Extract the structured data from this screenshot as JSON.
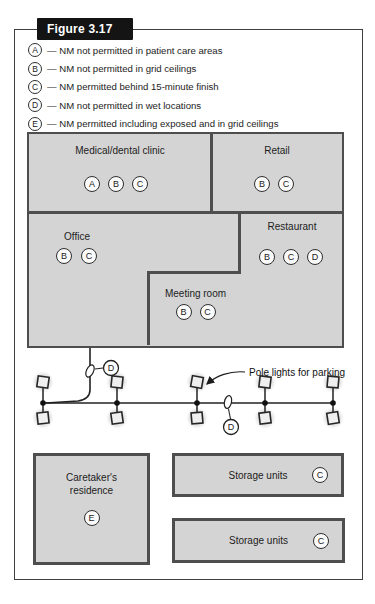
{
  "figure": {
    "title": "Figure 3.17"
  },
  "legend": {
    "items": [
      {
        "letter": "A",
        "text": "— NM not permitted in patient care areas"
      },
      {
        "letter": "B",
        "text": "— NM not permitted in grid ceilings"
      },
      {
        "letter": "C",
        "text": "— NM permitted behind 15-minute finish"
      },
      {
        "letter": "D",
        "text": "— NM not permitted in wet locations"
      },
      {
        "letter": "E",
        "text": "— NM permitted including exposed and in grid ceilings"
      }
    ]
  },
  "buildings": {
    "medical": {
      "name": "Medical/dental clinic",
      "codes": [
        "A",
        "B",
        "C"
      ]
    },
    "retail": {
      "name": "Retail",
      "codes": [
        "B",
        "C"
      ]
    },
    "office": {
      "name": "Office",
      "codes": [
        "B",
        "C"
      ]
    },
    "restaurant": {
      "name": "Restaurant",
      "codes": [
        "B",
        "C",
        "D"
      ]
    },
    "meeting": {
      "name": "Meeting room",
      "codes": [
        "B",
        "C"
      ]
    }
  },
  "parking": {
    "annotation": "Pole lights for parking",
    "feed_code": "D",
    "line_code": "D",
    "pole_count": 5
  },
  "bottom": {
    "caretaker": {
      "name_line1": "Caretaker's",
      "name_line2": "residence",
      "code": "E"
    },
    "storage_top": {
      "name": "Storage units",
      "code": "C"
    },
    "storage_bottom": {
      "name": "Storage units",
      "code": "C"
    }
  },
  "colors": {
    "building_fill": "#d4d4d4",
    "building_border": "#4e4e4e",
    "title_bg": "#141414",
    "line": "#222222"
  }
}
